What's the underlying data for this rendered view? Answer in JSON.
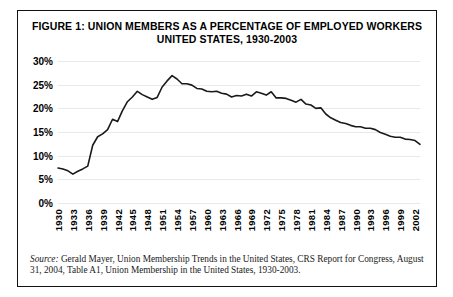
{
  "figure": {
    "title_line1": "FIGURE 1: UNION MEMBERS AS A PERCENTAGE OF EMPLOYED WORKERS",
    "title_line2": "UNITED STATES, 1930-2003",
    "source_label": "Source:",
    "source_text": " Gerald Mayer, Union Membership Trends in the United States, CRS Report for Congress, August 31, 2004, Table A1, Union Membership in the United States, 1930-2003."
  },
  "chart_data": {
    "type": "line",
    "title": "FIGURE 1: UNION MEMBERS AS A PERCENTAGE OF EMPLOYED WORKERS UNITED STATES, 1930-2003",
    "xlabel": "",
    "ylabel": "",
    "ylim": [
      0,
      30
    ],
    "xlim": [
      1930,
      2003
    ],
    "grid": true,
    "legend": "none",
    "line_color": "#1a1a1a",
    "ytick_labels": [
      "0%",
      "5%",
      "10%",
      "15%",
      "20%",
      "25%",
      "30%"
    ],
    "ytick_values": [
      0,
      5,
      10,
      15,
      20,
      25,
      30
    ],
    "xtick_labels": [
      "1930",
      "1933",
      "1936",
      "1939",
      "1942",
      "1945",
      "1948",
      "1951",
      "1954",
      "1957",
      "1960",
      "1963",
      "1966",
      "1969",
      "1972",
      "1975",
      "1978",
      "1981",
      "1984",
      "1987",
      "1990",
      "1993",
      "1996",
      "1999",
      "2002"
    ],
    "x": [
      1930,
      1931,
      1932,
      1933,
      1934,
      1935,
      1936,
      1937,
      1938,
      1939,
      1940,
      1941,
      1942,
      1943,
      1944,
      1945,
      1946,
      1947,
      1948,
      1949,
      1950,
      1951,
      1952,
      1953,
      1954,
      1955,
      1956,
      1957,
      1958,
      1959,
      1960,
      1961,
      1962,
      1963,
      1964,
      1965,
      1966,
      1967,
      1968,
      1969,
      1970,
      1971,
      1972,
      1973,
      1974,
      1975,
      1976,
      1977,
      1978,
      1979,
      1980,
      1981,
      1982,
      1983,
      1984,
      1985,
      1986,
      1987,
      1988,
      1989,
      1990,
      1991,
      1992,
      1993,
      1994,
      1995,
      1996,
      1997,
      1998,
      1999,
      2000,
      2001,
      2002,
      2003
    ],
    "values": [
      7.4,
      7.2,
      6.8,
      6.1,
      6.7,
      7.2,
      7.8,
      12.2,
      14.0,
      14.6,
      15.5,
      17.7,
      17.2,
      19.5,
      21.4,
      22.4,
      23.6,
      22.9,
      22.4,
      21.9,
      22.3,
      24.5,
      25.8,
      26.9,
      26.2,
      25.2,
      25.2,
      24.9,
      24.2,
      24.1,
      23.6,
      23.5,
      23.6,
      23.2,
      23.0,
      22.4,
      22.7,
      22.6,
      23.0,
      22.6,
      23.5,
      23.2,
      22.8,
      23.5,
      22.2,
      22.2,
      22.1,
      21.7,
      21.3,
      21.9,
      20.9,
      20.7,
      20.0,
      20.1,
      18.8,
      18.0,
      17.5,
      17.0,
      16.8,
      16.4,
      16.1,
      16.1,
      15.8,
      15.8,
      15.5,
      14.9,
      14.5,
      14.1,
      13.9,
      13.9,
      13.5,
      13.4,
      13.2,
      12.4
    ]
  }
}
